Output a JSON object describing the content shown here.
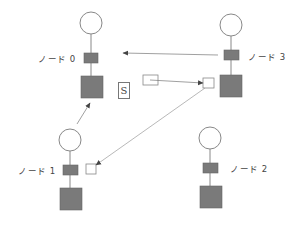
{
  "diagram": {
    "nodes": [
      {
        "id": 0,
        "label": "ノード 0"
      },
      {
        "id": 1,
        "label": "ノード 1"
      },
      {
        "id": 2,
        "label": "ノード 2"
      },
      {
        "id": 3,
        "label": "ノード 3"
      }
    ],
    "s_label": "S",
    "colors": {
      "node_fill": "#7a7a7a",
      "stroke": "#888888",
      "arrow": "#555555",
      "background": "#ffffff"
    }
  }
}
